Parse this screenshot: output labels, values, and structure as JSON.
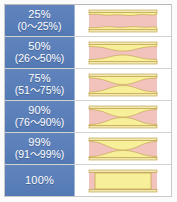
{
  "figure": {
    "name": "stenosis-grade-chart",
    "colors": {
      "label_blue": "#5b7fb9",
      "label_text": "#ffffff",
      "lumen_pink": "#f2c3bd",
      "plaque_yellow": "#f7ef9a",
      "wall_outline": "#b99a3e",
      "wall_fill": "#efe7b4",
      "grid_line": "#d2d2d2",
      "frame_border": "#c9c9c9",
      "page_background": "#fbfbfb"
    },
    "rows": [
      {
        "id": "grade-25",
        "percent": "25%",
        "range": "(0～25%)",
        "diagram": "vessel-stenosis-25",
        "narrowing": 0.25
      },
      {
        "id": "grade-50",
        "percent": "50%",
        "range": "(26～50%)",
        "diagram": "vessel-stenosis-50",
        "narrowing": 0.5
      },
      {
        "id": "grade-75",
        "percent": "75%",
        "range": "(51～75%)",
        "diagram": "vessel-stenosis-75",
        "narrowing": 0.75
      },
      {
        "id": "grade-90",
        "percent": "90%",
        "range": "(76～90%)",
        "diagram": "vessel-stenosis-90",
        "narrowing": 0.9
      },
      {
        "id": "grade-99",
        "percent": "99%",
        "range": "(91～99%)",
        "diagram": "vessel-stenosis-99",
        "narrowing": 0.99
      },
      {
        "id": "grade-100",
        "percent": "100%",
        "range": "",
        "diagram": "vessel-stenosis-100",
        "narrowing": 1.0
      }
    ]
  }
}
